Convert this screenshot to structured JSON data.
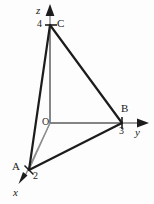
{
  "figure": {
    "background_color": "#fdfdfd",
    "stroke_dark": "#1c1c1c",
    "stroke_gray": "#8a8a8a",
    "stroke_mid": "#6e6e6e",
    "width": 154,
    "height": 204
  },
  "axes": {
    "z": {
      "label": "z",
      "arrow_tip": {
        "x": 50,
        "y": 5
      }
    },
    "y": {
      "label": "y",
      "arrow_tip": {
        "x": 148,
        "y": 123
      }
    },
    "x": {
      "label": "x",
      "arrow_tip": {
        "x": 20,
        "y": 182
      }
    },
    "origin": {
      "label": "O",
      "x": 50,
      "y": 123
    }
  },
  "ticks": [
    {
      "name": "z-tick-4",
      "label": "4",
      "axis": "z",
      "value": 4,
      "x": 50,
      "y": 25
    },
    {
      "name": "y-tick-3",
      "label": "3",
      "axis": "y",
      "value": 3,
      "x": 122,
      "y": 123
    },
    {
      "name": "x-tick-2",
      "label": "2",
      "axis": "x",
      "value": 2,
      "x": 29,
      "y": 170
    }
  ],
  "vertices": [
    {
      "name": "vertex-A",
      "label": "A",
      "coords": [
        2,
        0,
        0
      ],
      "x": 29,
      "y": 170
    },
    {
      "name": "vertex-B",
      "label": "B",
      "coords": [
        0,
        3,
        0
      ],
      "x": 122,
      "y": 123
    },
    {
      "name": "vertex-C",
      "label": "C",
      "coords": [
        0,
        0,
        4
      ],
      "x": 50,
      "y": 25
    },
    {
      "name": "vertex-O",
      "label": "O",
      "coords": [
        0,
        0,
        0
      ],
      "x": 50,
      "y": 123
    }
  ],
  "edges": [
    {
      "name": "edge-A-C",
      "from": "A",
      "to": "C",
      "weight": "thick"
    },
    {
      "name": "edge-C-B",
      "from": "C",
      "to": "B",
      "weight": "thick"
    },
    {
      "name": "edge-A-B",
      "from": "A",
      "to": "B",
      "weight": "thick"
    },
    {
      "name": "edge-O-C",
      "from": "O",
      "to": "C",
      "weight": "thin"
    },
    {
      "name": "edge-O-A",
      "from": "O",
      "to": "A",
      "weight": "thin"
    },
    {
      "name": "edge-O-B",
      "from": "O",
      "to": "B",
      "weight": "thin"
    }
  ],
  "labels": {
    "z_axis": "z",
    "y_axis": "y",
    "x_axis": "x",
    "origin": "O",
    "tick_z": "4",
    "tick_y": "3",
    "tick_x": "2",
    "vertex_a": "A",
    "vertex_b": "B",
    "vertex_c": "C"
  }
}
